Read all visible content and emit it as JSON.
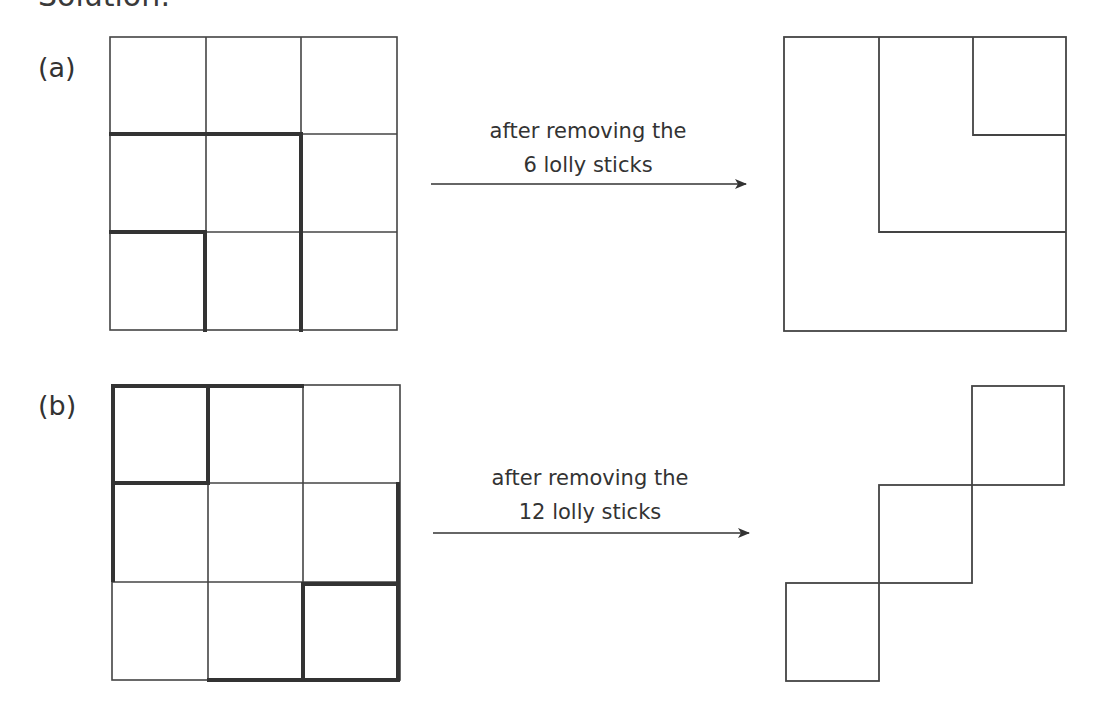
{
  "heading": "Solution:",
  "parts": [
    {
      "label": "(a)",
      "caption_line1": "after removing the",
      "caption_line2": "6 lolly sticks",
      "sticks_removed": 6
    },
    {
      "label": "(b)",
      "caption_line1": "after removing the",
      "caption_line2": "12 lolly sticks",
      "sticks_removed": 12
    }
  ],
  "colors": {
    "line": "#444444",
    "bold_line": "#333333",
    "background": "#ffffff"
  }
}
